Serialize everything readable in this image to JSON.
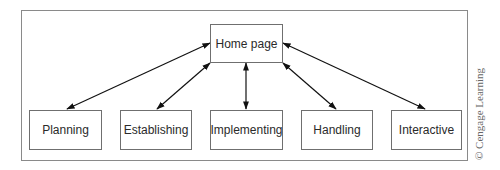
{
  "diagram": {
    "hub": {
      "label": "Home page",
      "x": 210,
      "y": 24,
      "w": 72,
      "h": 38
    },
    "nodes": [
      {
        "label": "Planning",
        "x": 29,
        "y": 110,
        "w": 72,
        "h": 39
      },
      {
        "label": "Establishing",
        "x": 120,
        "y": 110,
        "w": 72,
        "h": 39
      },
      {
        "label": "Implementing",
        "x": 210,
        "y": 110,
        "w": 72,
        "h": 39
      },
      {
        "label": "Handling",
        "x": 301,
        "y": 110,
        "w": 72,
        "h": 39
      },
      {
        "label": "Interactive",
        "x": 391,
        "y": 110,
        "w": 71,
        "h": 39
      }
    ],
    "edges": [
      {
        "from": "Home page",
        "to": "Planning",
        "type": "bidirectional"
      },
      {
        "from": "Home page",
        "to": "Establishing",
        "type": "bidirectional"
      },
      {
        "from": "Home page",
        "to": "Implementing",
        "type": "bidirectional"
      },
      {
        "from": "Home page",
        "to": "Handling",
        "type": "bidirectional"
      },
      {
        "from": "Home page",
        "to": "Interactive",
        "type": "bidirectional"
      }
    ],
    "colors": {
      "border": "#6f6f6f",
      "frame": "#8a8a8a",
      "arrow": "#111111"
    }
  },
  "credit": "© Cengage Learning"
}
